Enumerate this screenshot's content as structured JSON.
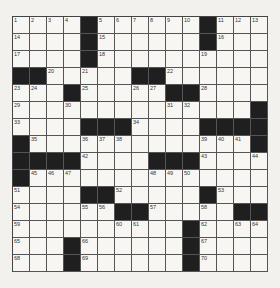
{
  "puzzle": {
    "rows": 15,
    "cols": 15,
    "grid": [
      [
        "1",
        "2",
        "3",
        "4",
        "#",
        "5",
        "6",
        "7",
        "8",
        "9",
        "10",
        "#",
        "11",
        "12",
        "13"
      ],
      [
        "14",
        "",
        "",
        "",
        "#",
        "15",
        "",
        "",
        "",
        "",
        "",
        "#",
        "16",
        "",
        ""
      ],
      [
        "17",
        "",
        "",
        "",
        "#",
        "18",
        "",
        "",
        "",
        "",
        "",
        "19",
        "",
        "",
        ""
      ],
      [
        "#",
        "#",
        "20",
        "",
        "21",
        "",
        "",
        "#",
        "#",
        "22",
        "",
        "",
        "",
        "",
        ""
      ],
      [
        "23",
        "24",
        "",
        "#",
        "25",
        "",
        "",
        "26",
        "27",
        "#",
        "#",
        "28",
        "",
        "",
        ""
      ],
      [
        "29",
        "",
        "",
        "30",
        "",
        "",
        "",
        "",
        "",
        "31",
        "32",
        "",
        "",
        "",
        "#"
      ],
      [
        "33",
        "",
        "",
        "",
        "#",
        "#",
        "#",
        "34",
        "",
        "",
        "",
        "#",
        "#",
        "#",
        "#"
      ],
      [
        "#",
        "35",
        "",
        "",
        "36",
        "37",
        "38",
        "",
        "",
        "",
        "",
        "39",
        "40",
        "41",
        "#"
      ],
      [
        "#",
        "#",
        "#",
        "#",
        "42",
        "",
        "",
        "",
        "#",
        "#",
        "#",
        "43",
        "",
        "",
        "44"
      ],
      [
        "#",
        "45",
        "46",
        "47",
        "",
        "",
        "",
        "",
        "48",
        "49",
        "50",
        "",
        "",
        "",
        ""
      ],
      [
        "51",
        "",
        "",
        "",
        "#",
        "#",
        "52",
        "",
        "",
        "",
        "",
        "#",
        "53",
        "",
        ""
      ],
      [
        "54",
        "",
        "",
        "",
        "55",
        "56",
        "#",
        "#",
        "57",
        "",
        "",
        "58",
        "",
        "#",
        "#"
      ],
      [
        "59",
        "",
        "",
        "",
        "",
        "",
        "60",
        "61",
        "",
        "",
        "#",
        "62",
        "",
        "63",
        "64"
      ],
      [
        "65",
        "",
        "",
        "#",
        "66",
        "",
        "",
        "",
        "",
        "",
        "#",
        "67",
        "",
        "",
        ""
      ],
      [
        "68",
        "",
        "",
        "#",
        "69",
        "",
        "",
        "",
        "",
        "",
        "#",
        "70",
        "",
        "",
        ""
      ]
    ]
  },
  "colors": {
    "background": "#f2f1ed",
    "cell": "#f7f6f3",
    "black_cell": "#1f1f1f",
    "grid_line": "#555555"
  }
}
